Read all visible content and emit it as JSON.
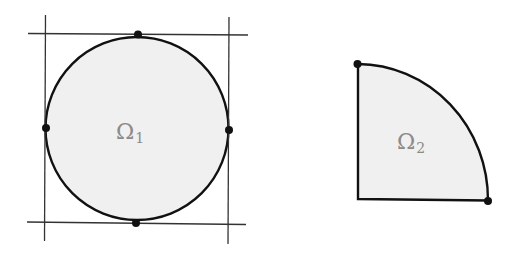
{
  "figure": {
    "colors": {
      "background": "#ffffff",
      "fill": "#f0f0f0",
      "stroke": "#111111",
      "guide_line": "#333333",
      "label": "#8a8a8a"
    },
    "domain1": {
      "label_main": "Ω",
      "label_sub": "1",
      "shape": "circle",
      "center": [
        137,
        128
      ],
      "radius": 92,
      "tangent_lines": {
        "left_x": 46,
        "right_x": 229,
        "top_y": 34,
        "bottom_y": 223
      },
      "points": [
        {
          "name": "top",
          "x": 138,
          "y": 34
        },
        {
          "name": "left",
          "x": 46,
          "y": 128
        },
        {
          "name": "right",
          "x": 229,
          "y": 130
        },
        {
          "name": "bottom",
          "x": 136,
          "y": 223
        }
      ]
    },
    "domain2": {
      "label_main": "Ω",
      "label_sub": "2",
      "shape": "quarter-disk",
      "corner": [
        358,
        199
      ],
      "radius": 130,
      "points": [
        {
          "name": "top",
          "x": 357,
          "y": 64
        },
        {
          "name": "bottom-right",
          "x": 488,
          "y": 201
        }
      ]
    }
  }
}
